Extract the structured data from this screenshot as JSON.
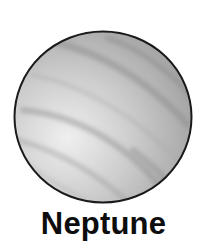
{
  "planet": {
    "name": "Neptune",
    "icon": "planet-neptune-icon",
    "colors": {
      "outline": "#1a1a1a",
      "surface_light": "#ececec",
      "surface_mid": "#bdbdbd",
      "surface_dark": "#9a9a9a",
      "band": "#8f8f8f"
    }
  }
}
